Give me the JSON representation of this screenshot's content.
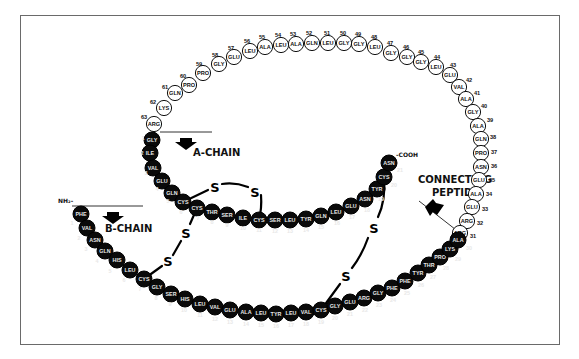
{
  "labels": {
    "a_chain": "A-CHAIN",
    "b_chain": "B-CHAIN",
    "connecting_peptide_line1": "CONNECTING",
    "connecting_peptide_line2": "PEPTIDE",
    "n_terminus": "NH₂-",
    "c_terminus": "-COOH",
    "disulfide": "S"
  },
  "connecting_peptide": [
    {
      "n": "63",
      "aa": "ARG",
      "x": 154,
      "y": 124,
      "nx": 144,
      "ny": 117
    },
    {
      "n": "62",
      "aa": "LYS",
      "x": 164,
      "y": 108,
      "nx": 153,
      "ny": 102
    },
    {
      "n": "61",
      "aa": "GLN",
      "x": 175,
      "y": 93,
      "nx": 165,
      "ny": 87
    },
    {
      "n": "60",
      "aa": "PRO",
      "x": 189,
      "y": 85,
      "nx": 183,
      "ny": 76
    },
    {
      "n": "59",
      "aa": "PRO",
      "x": 203,
      "y": 73,
      "nx": 199,
      "ny": 64
    },
    {
      "n": "58",
      "aa": "GLY",
      "x": 219,
      "y": 64,
      "nx": 215,
      "ny": 55
    },
    {
      "n": "57",
      "aa": "GLU",
      "x": 234,
      "y": 57,
      "nx": 231,
      "ny": 48
    },
    {
      "n": "56",
      "aa": "LEU",
      "x": 250,
      "y": 51,
      "nx": 247,
      "ny": 41
    },
    {
      "n": "55",
      "aa": "ALA",
      "x": 265,
      "y": 47,
      "nx": 262,
      "ny": 37
    },
    {
      "n": "54",
      "aa": "LEU",
      "x": 281,
      "y": 45,
      "nx": 278,
      "ny": 35
    },
    {
      "n": "53",
      "aa": "ALA",
      "x": 296,
      "y": 44,
      "nx": 293,
      "ny": 34
    },
    {
      "n": "52",
      "aa": "GLN",
      "x": 312,
      "y": 43,
      "nx": 309,
      "ny": 33
    },
    {
      "n": "51",
      "aa": "LEU",
      "x": 328,
      "y": 43,
      "nx": 327,
      "ny": 33
    },
    {
      "n": "50",
      "aa": "GLY",
      "x": 344,
      "y": 43,
      "nx": 343,
      "ny": 33
    },
    {
      "n": "49",
      "aa": "GLY",
      "x": 359,
      "y": 44,
      "nx": 358,
      "ny": 34
    },
    {
      "n": "48",
      "aa": "LEU",
      "x": 375,
      "y": 47,
      "nx": 374,
      "ny": 37
    },
    {
      "n": "47",
      "aa": "GLY",
      "x": 391,
      "y": 53,
      "nx": 390,
      "ny": 43
    },
    {
      "n": "46",
      "aa": "GLY",
      "x": 407,
      "y": 57,
      "nx": 406,
      "ny": 47
    },
    {
      "n": "45",
      "aa": "GLY",
      "x": 421,
      "y": 62,
      "nx": 421,
      "ny": 52
    },
    {
      "n": "44",
      "aa": "LEU",
      "x": 436,
      "y": 67,
      "nx": 437,
      "ny": 57
    },
    {
      "n": "43",
      "aa": "GLU",
      "x": 450,
      "y": 75,
      "nx": 453,
      "ny": 65
    },
    {
      "n": "42",
      "aa": "VAL",
      "x": 459,
      "y": 87,
      "nx": 469,
      "ny": 80
    },
    {
      "n": "41",
      "aa": "ALA",
      "x": 466,
      "y": 99,
      "nx": 477,
      "ny": 93
    },
    {
      "n": "40",
      "aa": "GLY",
      "x": 473,
      "y": 112,
      "nx": 484,
      "ny": 106
    },
    {
      "n": "39",
      "aa": "ALA",
      "x": 478,
      "y": 126,
      "nx": 490,
      "ny": 120
    },
    {
      "n": "38",
      "aa": "GLN",
      "x": 481,
      "y": 139,
      "nx": 493,
      "ny": 137
    },
    {
      "n": "37",
      "aa": "PRO",
      "x": 481,
      "y": 153,
      "nx": 494,
      "ny": 152
    },
    {
      "n": "36",
      "aa": "ASN",
      "x": 481,
      "y": 167,
      "nx": 494,
      "ny": 166
    },
    {
      "n": "35",
      "aa": "GLU",
      "x": 479,
      "y": 180,
      "nx": 492,
      "ny": 180
    },
    {
      "n": "34",
      "aa": "ALA",
      "x": 476,
      "y": 194,
      "nx": 489,
      "ny": 194
    },
    {
      "n": "33",
      "aa": "GLU",
      "x": 472,
      "y": 207,
      "nx": 485,
      "ny": 209
    },
    {
      "n": "32",
      "aa": "ARG",
      "x": 467,
      "y": 221,
      "nx": 480,
      "ny": 223
    },
    {
      "n": "31",
      "aa": "ARG",
      "x": 460,
      "y": 233,
      "nx": 473,
      "ny": 236
    }
  ],
  "a_chain": [
    {
      "n": "1",
      "aa": "GLY",
      "x": 152,
      "y": 140,
      "nx": 143,
      "ny": 138
    },
    {
      "n": "2",
      "aa": "ILE",
      "x": 150,
      "y": 153,
      "nx": 142,
      "ny": 153
    },
    {
      "n": "3",
      "aa": "VAL",
      "x": 153,
      "y": 168,
      "nx": 146,
      "ny": 173
    },
    {
      "n": "4",
      "aa": "GLU",
      "x": 162,
      "y": 181,
      "nx": 157,
      "ny": 189
    },
    {
      "n": "5",
      "aa": "GLN",
      "x": 172,
      "y": 193,
      "nx": 168,
      "ny": 201
    },
    {
      "n": "6",
      "aa": "CYS",
      "x": 183,
      "y": 202,
      "nx": 181,
      "ny": 212
    },
    {
      "n": "7",
      "aa": "CYS",
      "x": 197,
      "y": 208,
      "nx": 198,
      "ny": 218
    },
    {
      "n": "8",
      "aa": "THR",
      "x": 212,
      "y": 212,
      "nx": 212,
      "ny": 222
    },
    {
      "n": "9",
      "aa": "SER",
      "x": 227,
      "y": 215,
      "nx": 227,
      "ny": 225
    },
    {
      "n": "10",
      "aa": "ILE",
      "x": 243,
      "y": 218,
      "nx": 243,
      "ny": 228
    },
    {
      "n": "11",
      "aa": "CYS",
      "x": 259,
      "y": 220,
      "nx": 259,
      "ny": 230
    },
    {
      "n": "12",
      "aa": "SER",
      "x": 275,
      "y": 220,
      "nx": 275,
      "ny": 231
    },
    {
      "n": "13",
      "aa": "LEU",
      "x": 290,
      "y": 220,
      "nx": 290,
      "ny": 231
    },
    {
      "n": "14",
      "aa": "TYR",
      "x": 306,
      "y": 219,
      "nx": 306,
      "ny": 230
    },
    {
      "n": "15",
      "aa": "GLN",
      "x": 321,
      "y": 216,
      "nx": 321,
      "ny": 227
    },
    {
      "n": "16",
      "aa": "LEU",
      "x": 336,
      "y": 212,
      "nx": 337,
      "ny": 223
    },
    {
      "n": "17",
      "aa": "GLU",
      "x": 351,
      "y": 206,
      "nx": 352,
      "ny": 217
    },
    {
      "n": "18",
      "aa": "ASN",
      "x": 365,
      "y": 199,
      "nx": 367,
      "ny": 210
    },
    {
      "n": "19",
      "aa": "TYR",
      "x": 377,
      "y": 189,
      "nx": 381,
      "ny": 199
    },
    {
      "n": "20",
      "aa": "CYS",
      "x": 384,
      "y": 177,
      "nx": 394,
      "ny": 185
    },
    {
      "n": "21",
      "aa": "ASN",
      "x": 389,
      "y": 163,
      "nx": 400,
      "ny": 170
    }
  ],
  "b_chain": [
    {
      "n": "1",
      "aa": "PHE",
      "x": 81,
      "y": 214,
      "nx": 72,
      "ny": 223
    },
    {
      "n": "2",
      "aa": "VAL",
      "x": 87,
      "y": 228,
      "nx": 79,
      "ny": 238
    },
    {
      "n": "3",
      "aa": "ASN",
      "x": 95,
      "y": 240,
      "nx": 86,
      "ny": 249
    },
    {
      "n": "4",
      "aa": "GLN",
      "x": 105,
      "y": 251,
      "nx": 97,
      "ny": 261
    },
    {
      "n": "5",
      "aa": "HIS",
      "x": 117,
      "y": 260,
      "nx": 110,
      "ny": 271
    },
    {
      "n": "6",
      "aa": "LEU",
      "x": 130,
      "y": 270,
      "nx": 124,
      "ny": 280
    },
    {
      "n": "7",
      "aa": "CYS",
      "x": 144,
      "y": 279,
      "nx": 140,
      "ny": 289
    },
    {
      "n": "8",
      "aa": "GLY",
      "x": 157,
      "y": 287,
      "nx": 156,
      "ny": 298
    },
    {
      "n": "9",
      "aa": "SER",
      "x": 171,
      "y": 294,
      "nx": 170,
      "ny": 304
    },
    {
      "n": "10",
      "aa": "HIS",
      "x": 185,
      "y": 299,
      "nx": 184,
      "ny": 310
    },
    {
      "n": "11",
      "aa": "LEU",
      "x": 200,
      "y": 304,
      "nx": 200,
      "ny": 315
    },
    {
      "n": "12",
      "aa": "VAL",
      "x": 215,
      "y": 307,
      "nx": 215,
      "ny": 319
    },
    {
      "n": "13",
      "aa": "GLU",
      "x": 230,
      "y": 310,
      "nx": 230,
      "ny": 322
    },
    {
      "n": "14",
      "aa": "ALA",
      "x": 246,
      "y": 312,
      "nx": 246,
      "ny": 324
    },
    {
      "n": "15",
      "aa": "LEU",
      "x": 261,
      "y": 313,
      "nx": 261,
      "ny": 325
    },
    {
      "n": "16",
      "aa": "TYR",
      "x": 276,
      "y": 314,
      "nx": 276,
      "ny": 326
    },
    {
      "n": "17",
      "aa": "LEU",
      "x": 291,
      "y": 313,
      "nx": 291,
      "ny": 325
    },
    {
      "n": "18",
      "aa": "VAL",
      "x": 306,
      "y": 312,
      "nx": 306,
      "ny": 324
    },
    {
      "n": "19",
      "aa": "CYS",
      "x": 321,
      "y": 310,
      "nx": 321,
      "ny": 322
    },
    {
      "n": "20",
      "aa": "GLY",
      "x": 335,
      "y": 306,
      "nx": 335,
      "ny": 318
    },
    {
      "n": "21",
      "aa": "GLU",
      "x": 350,
      "y": 302,
      "nx": 350,
      "ny": 314
    },
    {
      "n": "22",
      "aa": "ARG",
      "x": 364,
      "y": 298,
      "nx": 365,
      "ny": 310
    },
    {
      "n": "23",
      "aa": "GLY",
      "x": 378,
      "y": 293,
      "nx": 379,
      "ny": 305
    },
    {
      "n": "24",
      "aa": "PHE",
      "x": 392,
      "y": 288,
      "nx": 393,
      "ny": 300
    },
    {
      "n": "25",
      "aa": "PHE",
      "x": 405,
      "y": 281,
      "nx": 407,
      "ny": 293
    },
    {
      "n": "26",
      "aa": "TYR",
      "x": 418,
      "y": 273,
      "nx": 421,
      "ny": 285
    },
    {
      "n": "27",
      "aa": "THR",
      "x": 429,
      "y": 265,
      "nx": 433,
      "ny": 277
    },
    {
      "n": "28",
      "aa": "PRO",
      "x": 440,
      "y": 257,
      "nx": 446,
      "ny": 268
    },
    {
      "n": "29",
      "aa": "LYS",
      "x": 450,
      "y": 249,
      "nx": 458,
      "ny": 259
    },
    {
      "n": "30",
      "aa": "ALA",
      "x": 458,
      "y": 240,
      "nx": 469,
      "ny": 248
    }
  ],
  "colors": {
    "ink": "#0a0a0a",
    "frame": "#6a6a6a",
    "background": "#ffffff"
  }
}
